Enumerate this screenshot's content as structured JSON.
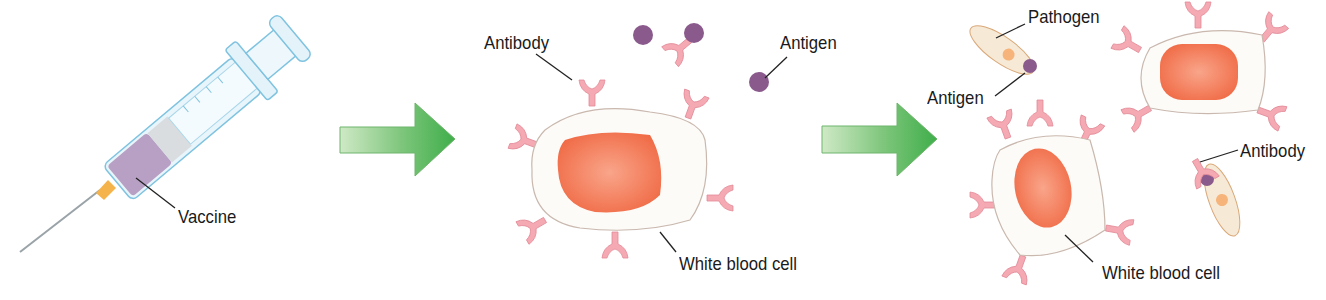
{
  "diagram": {
    "colors": {
      "arrow": "#5cb85c",
      "arrow_light": "#c8e6c0",
      "cell_body": "#fdfbf8",
      "cell_outline": "#c9b8ae",
      "nucleus": "#f37a55",
      "antibody": "#f4a9b3",
      "antigen": "#8a5a8c",
      "pathogen": "#f6e9d6",
      "vaccine": "#b7a0c4",
      "syringe": "#e4f3fa",
      "needle_hub": "#f5b34b"
    },
    "panels": [
      {
        "name": "vaccine-injection",
        "labels": {
          "vaccine": "Vaccine"
        }
      },
      {
        "name": "antibody-production",
        "labels": {
          "antibody": "Antibody",
          "antigen": "Antigen",
          "white_blood_cell": "White blood cell"
        }
      },
      {
        "name": "immune-response",
        "labels": {
          "pathogen": "Pathogen",
          "antigen": "Antigen",
          "antibody": "Antibody",
          "white_blood_cell": "White blood cell"
        }
      }
    ],
    "arrows": [
      "step-1-to-2",
      "step-2-to-3"
    ]
  }
}
